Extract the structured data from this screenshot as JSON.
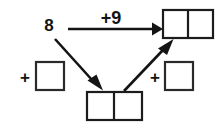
{
  "diagram": {
    "type": "arrow-math-diagram",
    "canvas": {
      "width": 224,
      "height": 130,
      "background": "#ffffff"
    },
    "ink_color": "#141414",
    "box_fill": "#ffffff",
    "start_number": {
      "name": "start-number",
      "text": "8",
      "x": 49,
      "y": 31
    },
    "operations": {
      "top_arrow_label": {
        "name": "plus-nine-label",
        "text": "+9",
        "x": 111,
        "y": 24
      },
      "left_plus": {
        "name": "left-plus-sign",
        "text": "+",
        "x": 25,
        "y": 83
      },
      "right_plus": {
        "name": "right-plus-sign",
        "text": "+",
        "x": 155,
        "y": 83
      }
    },
    "answer_boxes": [
      {
        "name": "top-right-answer-box",
        "role": "two-cell",
        "value": "",
        "x": 163,
        "y": 10,
        "width": 50,
        "height": 28,
        "cells": 2
      },
      {
        "name": "bottom-answer-box",
        "role": "two-cell",
        "value": "",
        "x": 87,
        "y": 92,
        "width": 55,
        "height": 28,
        "cells": 2
      }
    ],
    "addend_boxes": [
      {
        "name": "left-addend-box",
        "role": "single-cell",
        "value": "",
        "x": 36,
        "y": 62,
        "width": 28,
        "height": 28
      },
      {
        "name": "right-addend-box",
        "role": "single-cell",
        "value": "",
        "x": 165,
        "y": 62,
        "width": 28,
        "height": 28
      }
    ],
    "arrows": [
      {
        "name": "arrow-plus-nine-horizontal",
        "from": [
          68,
          29
        ],
        "to": [
          161,
          29
        ],
        "direction": "right"
      },
      {
        "name": "arrow-down-right-to-bottom-box",
        "from": [
          55,
          38
        ],
        "to": [
          101,
          89
        ],
        "direction": "down-right"
      },
      {
        "name": "arrow-up-right-to-top-box",
        "from": [
          124,
          91
        ],
        "to": [
          172,
          41
        ],
        "direction": "up-right"
      }
    ]
  }
}
